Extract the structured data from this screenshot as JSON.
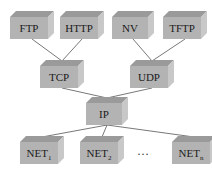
{
  "diagram": {
    "type": "protocol-stack-tree",
    "nodes": [
      {
        "id": "ftp",
        "label": "FTP",
        "sub": ""
      },
      {
        "id": "http",
        "label": "HTTP",
        "sub": ""
      },
      {
        "id": "nv",
        "label": "NV",
        "sub": ""
      },
      {
        "id": "tftp",
        "label": "TFTP",
        "sub": ""
      },
      {
        "id": "tcp",
        "label": "TCP",
        "sub": ""
      },
      {
        "id": "udp",
        "label": "UDP",
        "sub": ""
      },
      {
        "id": "ip",
        "label": "IP",
        "sub": ""
      },
      {
        "id": "net1",
        "label": "NET",
        "sub": "1"
      },
      {
        "id": "net2",
        "label": "NET",
        "sub": "2"
      },
      {
        "id": "netn",
        "label": "NET",
        "sub": "n"
      }
    ],
    "edges": [
      [
        "ftp",
        "tcp"
      ],
      [
        "http",
        "tcp"
      ],
      [
        "nv",
        "udp"
      ],
      [
        "tftp",
        "udp"
      ],
      [
        "tcp",
        "ip"
      ],
      [
        "udp",
        "ip"
      ],
      [
        "ip",
        "net1"
      ],
      [
        "ip",
        "net2"
      ],
      [
        "ip",
        "netn"
      ]
    ],
    "ellipsis": "…"
  }
}
